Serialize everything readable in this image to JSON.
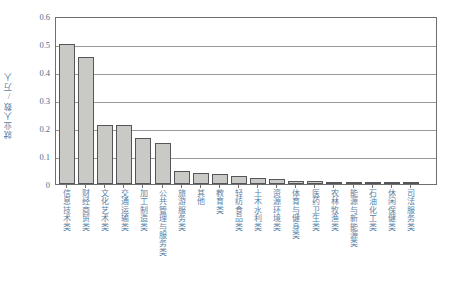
{
  "chart_data": {
    "type": "bar",
    "title": "",
    "xlabel": "",
    "ylabel": "就业人数/万人",
    "ylim": [
      0,
      0.6
    ],
    "ytick_labels": [
      "0.6",
      "0.5",
      "0.4",
      "0.3",
      "0.2",
      "0.1",
      "0"
    ],
    "ytick_values": [
      0.6,
      0.5,
      0.4,
      0.3,
      0.2,
      0.1,
      0
    ],
    "grid": true,
    "legend": "none",
    "categories": [
      "信息技术类",
      "财经商贸类",
      "文化艺术类",
      "交通运输类",
      "加工制造类",
      "公共管理与服务类",
      "旅游服务类",
      "其他",
      "教育类",
      "轻纺食品类",
      "土木水利类",
      "资源环境类",
      "体育与健身类",
      "医药卫生类",
      "农林牧渔类",
      "能源与新能源类",
      "石油化工类",
      "休闲保健类",
      "司法服务类"
    ],
    "values": [
      0.5,
      0.455,
      0.21,
      0.21,
      0.165,
      0.145,
      0.045,
      0.04,
      0.035,
      0.03,
      0.02,
      0.018,
      0.012,
      0.01,
      0.008,
      0.005,
      0.004,
      0.003,
      0.002
    ],
    "bar_color": "#c9c9c5",
    "bar_edge_color": "#55555a",
    "axis_color": "#6f6f6f",
    "grid_color": "#9a9a9a",
    "label_color": "#5a7fa5"
  }
}
